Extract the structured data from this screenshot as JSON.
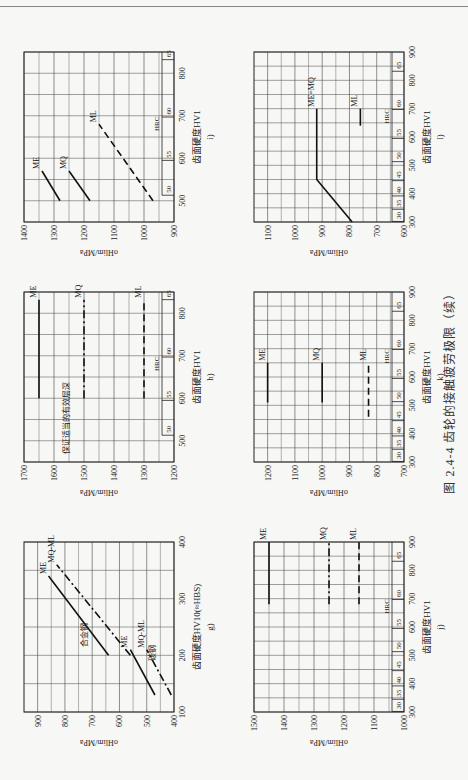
{
  "figure": {
    "caption": "图 2.4-4   齿轮的接触疲劳极限（续）"
  },
  "chart_data": [
    {
      "id": "g",
      "type": "line",
      "sublabel": "g)",
      "xlabel": "齿面硬度HV10(≈HBS)",
      "ylabel": "σHlim/MPa",
      "xlim": [
        100,
        400
      ],
      "ylim": [
        400,
        950
      ],
      "xticks": [
        100,
        200,
        300,
        400
      ],
      "yticks": [
        400,
        500,
        600,
        700,
        800,
        900
      ],
      "annotations": [
        {
          "text": "合金钢",
          "x": 215,
          "y": 720
        },
        {
          "text": "碳钢",
          "x": 190,
          "y": 470
        }
      ],
      "series": [
        {
          "name": "ME",
          "group": "合金钢",
          "style": "solid",
          "points": [
            [
              200,
              640
            ],
            [
              340,
              860
            ]
          ]
        },
        {
          "name": "MQ-ML",
          "group": "合金钢",
          "style": "dashdot",
          "points": [
            [
              200,
              560
            ],
            [
              360,
              830
            ]
          ]
        },
        {
          "name": "ME",
          "group": "碳钢",
          "style": "solid",
          "points": [
            [
              130,
              470
            ],
            [
              210,
              560
            ]
          ]
        },
        {
          "name": "MQ-ML",
          "group": "碳钢",
          "style": "dashdot",
          "points": [
            [
              130,
              410
            ],
            [
              210,
              500
            ]
          ]
        }
      ]
    },
    {
      "id": "h",
      "type": "line",
      "sublabel": "h)",
      "xlabel": "齿面硬度HV1",
      "ylabel": "σHlim/MPa",
      "xlim": [
        450,
        850
      ],
      "ylim": [
        1200,
        1700
      ],
      "xticks": [
        500,
        600,
        700,
        800
      ],
      "yticks": [
        1200,
        1300,
        1400,
        1500,
        1600,
        1700
      ],
      "hrc_ticks": [
        {
          "hrc": "50",
          "hv": 513
        },
        {
          "hrc": "55",
          "hv": 595
        },
        {
          "hrc": "60",
          "hv": 697
        },
        {
          "hrc": "65",
          "hv": 832
        }
      ],
      "annotations": [
        {
          "text": "保证适当的有效层深",
          "x": 470,
          "y": 1550,
          "rotated": true
        }
      ],
      "series": [
        {
          "name": "ME",
          "style": "solid",
          "points": [
            [
              600,
              1650
            ],
            [
              832,
              1650
            ]
          ]
        },
        {
          "name": "MQ",
          "style": "dashdot",
          "points": [
            [
              600,
              1500
            ],
            [
              832,
              1500
            ]
          ]
        },
        {
          "name": "ML",
          "style": "dashed",
          "points": [
            [
              600,
              1300
            ],
            [
              832,
              1300
            ]
          ]
        }
      ]
    },
    {
      "id": "i",
      "type": "line",
      "sublabel": "i)",
      "xlabel": "齿面硬度HV1",
      "ylabel": "σHlim/MPa",
      "xlim": [
        450,
        850
      ],
      "ylim": [
        900,
        1400
      ],
      "xticks": [
        500,
        600,
        700,
        800
      ],
      "yticks": [
        900,
        1000,
        1100,
        1200,
        1300,
        1400
      ],
      "hrc_ticks": [
        {
          "hrc": "50",
          "hv": 513
        },
        {
          "hrc": "55",
          "hv": 595
        },
        {
          "hrc": "60",
          "hv": 697
        },
        {
          "hrc": "65",
          "hv": 832
        }
      ],
      "series": [
        {
          "name": "ME",
          "style": "solid",
          "points": [
            [
              500,
              1280
            ],
            [
              570,
              1340
            ]
          ]
        },
        {
          "name": "MQ",
          "style": "solid",
          "points": [
            [
              500,
              1180
            ],
            [
              570,
              1250
            ]
          ]
        },
        {
          "name": "ML",
          "style": "dashed",
          "points": [
            [
              500,
              970
            ],
            [
              680,
              1150
            ]
          ]
        }
      ]
    },
    {
      "id": "j",
      "type": "line",
      "sublabel": "j)",
      "xlabel": "齿面硬度HV1",
      "ylabel": "σHlim/MPa",
      "xlim": [
        300,
        900
      ],
      "ylim": [
        1000,
        1500
      ],
      "xticks": [
        300,
        400,
        500,
        600,
        700,
        800,
        900
      ],
      "yticks": [
        1000,
        1100,
        1200,
        1300,
        1400,
        1500
      ],
      "hrc_ticks": [
        {
          "hrc": "30",
          "hv": 302
        },
        {
          "hrc": "35",
          "hv": 345
        },
        {
          "hrc": "40",
          "hv": 392
        },
        {
          "hrc": "45",
          "hv": 446
        },
        {
          "hrc": "50",
          "hv": 513
        },
        {
          "hrc": "55",
          "hv": 595
        },
        {
          "hrc": "60",
          "hv": 697
        },
        {
          "hrc": "65",
          "hv": 832
        }
      ],
      "series": [
        {
          "name": "ME",
          "style": "solid",
          "points": [
            [
              680,
              1450
            ],
            [
              900,
              1450
            ]
          ]
        },
        {
          "name": "MQ",
          "style": "dashdot",
          "points": [
            [
              680,
              1250
            ],
            [
              900,
              1250
            ]
          ]
        },
        {
          "name": "ML",
          "style": "dashed",
          "points": [
            [
              680,
              1150
            ],
            [
              900,
              1150
            ]
          ]
        }
      ]
    },
    {
      "id": "k",
      "type": "line",
      "sublabel": "k)",
      "xlabel": "齿面硬度HV1",
      "ylabel": "σHlim/MPa",
      "xlim": [
        300,
        900
      ],
      "ylim": [
        700,
        1250
      ],
      "xticks": [
        300,
        400,
        500,
        600,
        700,
        800,
        900
      ],
      "yticks": [
        700,
        800,
        900,
        1000,
        1100,
        1200
      ],
      "hrc_ticks": [
        {
          "hrc": "30",
          "hv": 302
        },
        {
          "hrc": "35",
          "hv": 345
        },
        {
          "hrc": "40",
          "hv": 392
        },
        {
          "hrc": "45",
          "hv": 446
        },
        {
          "hrc": "50",
          "hv": 513
        },
        {
          "hrc": "55",
          "hv": 595
        },
        {
          "hrc": "60",
          "hv": 697
        },
        {
          "hrc": "65",
          "hv": 832
        }
      ],
      "series": [
        {
          "name": "ME",
          "style": "solid",
          "points": [
            [
              510,
              1200
            ],
            [
              650,
              1200
            ]
          ]
        },
        {
          "name": "MQ",
          "style": "solid",
          "points": [
            [
              510,
              1000
            ],
            [
              650,
              1000
            ]
          ]
        },
        {
          "name": "ML",
          "style": "dashed",
          "points": [
            [
              460,
              830
            ],
            [
              650,
              830
            ]
          ]
        }
      ]
    },
    {
      "id": "l",
      "type": "line",
      "sublabel": "l)",
      "xlabel": "齿面硬度HV1",
      "ylabel": "σHlim/MPa",
      "xlim": [
        300,
        900
      ],
      "ylim": [
        600,
        1150
      ],
      "xticks": [
        300,
        400,
        500,
        600,
        700,
        800,
        900
      ],
      "yticks": [
        600,
        700,
        800,
        900,
        1000,
        1100
      ],
      "hrc_ticks": [
        {
          "hrc": "30",
          "hv": 302
        },
        {
          "hrc": "35",
          "hv": 345
        },
        {
          "hrc": "40",
          "hv": 392
        },
        {
          "hrc": "45",
          "hv": 446
        },
        {
          "hrc": "50",
          "hv": 513
        },
        {
          "hrc": "55",
          "hv": 595
        },
        {
          "hrc": "60",
          "hv": 697
        },
        {
          "hrc": "65",
          "hv": 832
        }
      ],
      "series": [
        {
          "name": "ME=MQ",
          "style": "solid",
          "points": [
            [
              300,
              790
            ],
            [
              450,
              920
            ],
            [
              700,
              920
            ]
          ]
        },
        {
          "name": "ML",
          "style": "solid",
          "points": [
            [
              640,
              760
            ],
            [
              700,
              760
            ]
          ]
        }
      ]
    }
  ]
}
